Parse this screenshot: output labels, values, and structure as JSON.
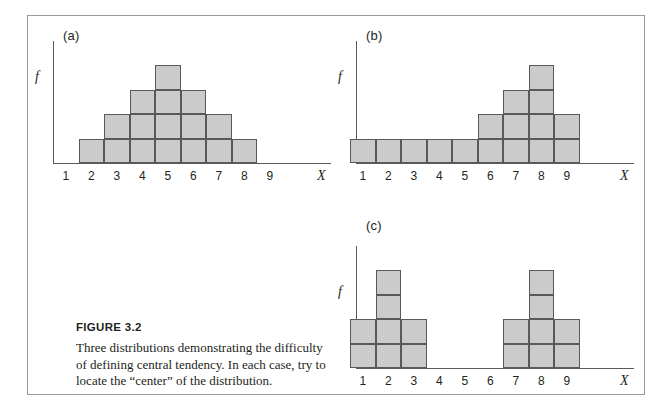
{
  "figure": {
    "caption_title": "FIGURE 3.2",
    "caption_body": "Three distributions demonstrating the difficulty of defining central tendency. In each case, try to locate the “center” of the distribution."
  },
  "chart_data": [
    {
      "type": "bar",
      "panel": "(a)",
      "title": "",
      "xlabel": "X",
      "ylabel": "f",
      "categories": [
        "1",
        "2",
        "3",
        "4",
        "5",
        "6",
        "7",
        "8",
        "9"
      ],
      "values": [
        0,
        1,
        2,
        3,
        4,
        3,
        2,
        1,
        0
      ],
      "ylim": [
        0,
        5
      ],
      "grid": false,
      "legend": "none",
      "bar_fill": "#cbcbcb",
      "bar_stroke": "#59595b",
      "note": "symmetric unimodal distribution"
    },
    {
      "type": "bar",
      "panel": "(b)",
      "title": "",
      "xlabel": "X",
      "ylabel": "f",
      "categories": [
        "1",
        "2",
        "3",
        "4",
        "5",
        "6",
        "7",
        "8",
        "9"
      ],
      "values": [
        1,
        1,
        1,
        1,
        1,
        2,
        3,
        4,
        2
      ],
      "ylim": [
        0,
        5
      ],
      "grid": false,
      "legend": "none",
      "bar_fill": "#cbcbcb",
      "bar_stroke": "#59595b",
      "note": "negatively skewed distribution"
    },
    {
      "type": "bar",
      "panel": "(c)",
      "title": "",
      "xlabel": "X",
      "ylabel": "f",
      "categories": [
        "1",
        "2",
        "3",
        "4",
        "5",
        "6",
        "7",
        "8",
        "9"
      ],
      "values": [
        2,
        4,
        2,
        0,
        0,
        0,
        2,
        4,
        2
      ],
      "ylim": [
        0,
        5
      ],
      "grid": false,
      "legend": "none",
      "bar_fill": "#cbcbcb",
      "bar_stroke": "#59595b",
      "note": "bimodal distribution"
    }
  ]
}
